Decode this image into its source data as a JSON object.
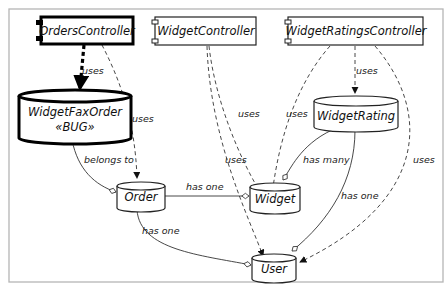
{
  "diagram": {
    "type": "uml-dependency",
    "nodes": {
      "orders_controller": {
        "label": "OrdersController",
        "kind": "component",
        "highlight": true
      },
      "widget_controller": {
        "label": "WidgetController",
        "kind": "component"
      },
      "widget_ratings_controller": {
        "label": "WidgetRatingsController",
        "kind": "component"
      },
      "widget_fax_order": {
        "label": "WidgetFaxOrder",
        "stereotype": "«BUG»",
        "kind": "model",
        "highlight": true
      },
      "widget_rating": {
        "label": "WidgetRating",
        "kind": "model"
      },
      "order": {
        "label": "Order",
        "kind": "model"
      },
      "widget": {
        "label": "Widget",
        "kind": "model"
      },
      "user": {
        "label": "User",
        "kind": "model"
      }
    },
    "edges": [
      {
        "from": "OrdersController",
        "to": "WidgetFaxOrder",
        "label": "uses",
        "style": "dashed-bold"
      },
      {
        "from": "OrdersController",
        "to": "Order",
        "label": "uses",
        "style": "dashed"
      },
      {
        "from": "WidgetController",
        "to": "Widget",
        "label": "uses",
        "style": "dashed"
      },
      {
        "from": "WidgetController",
        "to": "User",
        "label": "uses",
        "style": "dashed"
      },
      {
        "from": "WidgetRatingsController",
        "to": "WidgetRating",
        "label": "uses",
        "style": "dashed"
      },
      {
        "from": "WidgetRatingsController",
        "to": "Widget",
        "label": "uses",
        "style": "dashed"
      },
      {
        "from": "WidgetRatingsController",
        "to": "User",
        "label": "uses",
        "style": "dashed"
      },
      {
        "from": "WidgetFaxOrder",
        "to": "Order",
        "label": "belongs to",
        "style": "solid"
      },
      {
        "from": "Order",
        "to": "Widget",
        "label": "has one",
        "style": "solid"
      },
      {
        "from": "Order",
        "to": "User",
        "label": "has one",
        "style": "solid"
      },
      {
        "from": "WidgetRating",
        "to": "Widget",
        "label": "has many",
        "style": "solid"
      },
      {
        "from": "WidgetRating",
        "to": "User",
        "label": "has one",
        "style": "solid"
      }
    ],
    "labels": {
      "uses": "uses",
      "belongs_to": "belongs to",
      "has_one": "has one",
      "has_many": "has many"
    },
    "colors": {
      "stroke": "#222222",
      "frame": "#b5b5b5",
      "background": "#ffffff"
    }
  }
}
